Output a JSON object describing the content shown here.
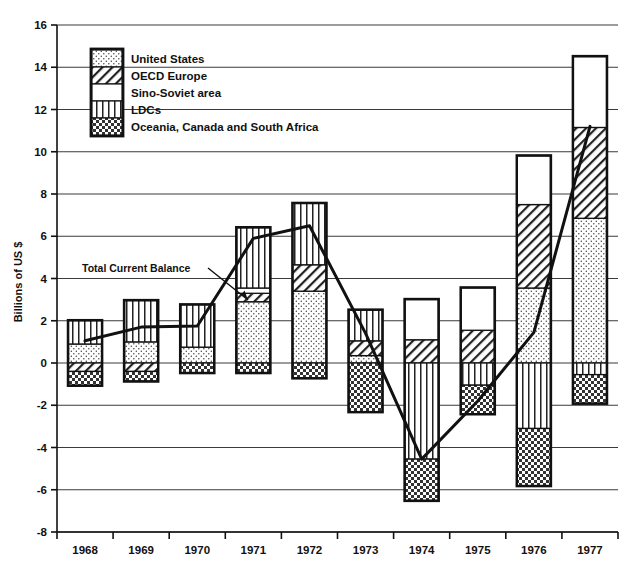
{
  "chart_data": {
    "type": "bar",
    "title": "",
    "subtitle": "",
    "xlabel": "",
    "ylabel": "Billions of US $",
    "ylim": [
      -8,
      16
    ],
    "ytick_step": 2,
    "yticks": [
      "16",
      "14",
      "12",
      "10",
      "8",
      "6",
      "4",
      "2",
      "0",
      "-2",
      "-4",
      "-6",
      "-8"
    ],
    "grid": true,
    "grid_orientation": "horizontal",
    "stacked": true,
    "legend_position": "inside-upper-left",
    "categories": [
      "1968",
      "1969",
      "1970",
      "1971",
      "1972",
      "1973",
      "1974",
      "1975",
      "1976",
      "1977"
    ],
    "series": [
      {
        "name": "United States",
        "pattern": "fine-dots",
        "values": [
          0.9,
          1.0,
          0.75,
          2.9,
          3.4,
          0.35,
          0.0,
          0.0,
          3.55,
          6.85
        ]
      },
      {
        "name": "OECD Europe",
        "pattern": "diagonal-hatch",
        "values": [
          -0.4,
          -0.4,
          0.0,
          0.4,
          1.25,
          0.7,
          1.1,
          1.55,
          3.95,
          4.3
        ]
      },
      {
        "name": "Sino-Soviet area",
        "pattern": "solid-white",
        "values": [
          0.0,
          0.0,
          0.0,
          0.25,
          0.0,
          0.0,
          1.9,
          2.0,
          2.3,
          3.35
        ]
      },
      {
        "name": "LDCs",
        "pattern": "vertical-lines",
        "values": [
          1.1,
          1.95,
          2.0,
          2.85,
          2.9,
          1.45,
          -4.55,
          -1.05,
          -3.1,
          -0.55
        ]
      },
      {
        "name": "Oceania, Canada and South Africa",
        "pattern": "checker",
        "values": [
          -0.65,
          -0.45,
          -0.45,
          -0.45,
          -0.7,
          -2.3,
          -1.95,
          -1.35,
          -2.7,
          -1.35
        ]
      }
    ],
    "annotations": [
      {
        "name": "total-current-balance",
        "label": "Total Current Balance",
        "type": "line",
        "series_name": "Total Current Balance",
        "values": [
          1.05,
          1.7,
          1.75,
          5.9,
          6.5,
          1.4,
          -4.55,
          -1.8,
          1.45,
          11.2
        ]
      }
    ]
  },
  "legend": {
    "items": [
      {
        "label": "United States",
        "pattern": "fine-dots"
      },
      {
        "label": "OECD Europe",
        "pattern": "diagonal-hatch"
      },
      {
        "label": "Sino-Soviet area",
        "pattern": "solid-white"
      },
      {
        "label": "LDCs",
        "pattern": "vertical-lines"
      },
      {
        "label": "Oceania, Canada and South Africa",
        "pattern": "checker"
      }
    ]
  },
  "colors": {
    "ink": "#111111",
    "background": "#ffffff",
    "grid": "#3a3a3a",
    "pattern_fill": "#ffffff"
  }
}
